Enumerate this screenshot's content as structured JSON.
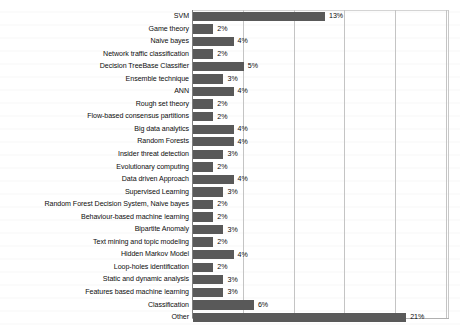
{
  "chart_data": {
    "type": "bar",
    "orientation": "horizontal",
    "title": "",
    "subtitle": "",
    "xlabel": "",
    "ylabel": "",
    "xlim": [
      0,
      25
    ],
    "grid": true,
    "gridlines_at": [
      5,
      10,
      15,
      20,
      25
    ],
    "legend": "none",
    "value_suffix": "%",
    "categories": [
      "SVM",
      "Game theory",
      "Naive bayes",
      "Network traffic classification",
      "Decision TreeBase Classifier",
      "Ensemble technique",
      "ANN",
      "Rough set theory",
      "Flow-based consensus partitions",
      "Big data analytics",
      "Random Forests",
      "Insider threat detection",
      "Evolutionary computing",
      "Data driven Approach",
      "Supervised Learning",
      "Random Forest Decision System, Naive bayes",
      "Behaviour-based machine learning",
      "Bipartite Anomaly",
      "Text mining and topic modeling",
      "Hidden Markov Model",
      "Loop-holes identification",
      "Static and dynamic analysis",
      "Features based machine learning",
      "Classification",
      "Other"
    ],
    "values": [
      13,
      2,
      4,
      2,
      5,
      3,
      4,
      2,
      2,
      4,
      4,
      3,
      2,
      4,
      3,
      2,
      2,
      3,
      2,
      4,
      2,
      3,
      3,
      6,
      21
    ],
    "value_labels": [
      "13%",
      "2%",
      "4%",
      "2%",
      "5%",
      "3%",
      "4%",
      "2%",
      "2%",
      "4%",
      "4%",
      "3%",
      "2%",
      "4%",
      "3%",
      "2%",
      "2%",
      "3%",
      "2%",
      "4%",
      "2%",
      "3%",
      "3%",
      "6%",
      "21%"
    ],
    "colors": {
      "bar": "#595959",
      "gridline": "#c4c4c4",
      "axis": "#808080",
      "text": "#0d0d0d",
      "background": "#ffffff"
    }
  }
}
